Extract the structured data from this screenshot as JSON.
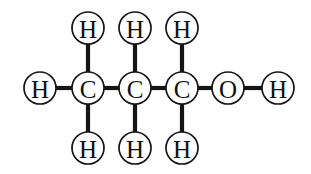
{
  "figure": {
    "background_color": "#ffffff",
    "bond_color": "#151515",
    "atom_circle_fill": "#ffffff",
    "atom_circle_stroke": "#151515",
    "atom_label_color": "#111111",
    "atom_radius": 16,
    "bond_width": 4.2,
    "circle_stroke_width": 1.7
  },
  "chart_data": {
    "type": "diagram",
    "diagram_kind": "chemical-structural-formula",
    "molecule": "propan-1-ol",
    "formula": "C3H8O",
    "condensed_formula": "CH3CH2CH2OH",
    "title": "",
    "atoms": [
      {
        "id": "H1",
        "label": "H",
        "element": "H",
        "x": 40,
        "y": 88,
        "role": "methyl-hydrogen-left"
      },
      {
        "id": "H2",
        "label": "H",
        "element": "H",
        "x": 88,
        "y": 28,
        "role": "hydrogen-top-c1"
      },
      {
        "id": "H3",
        "label": "H",
        "element": "H",
        "x": 88,
        "y": 148,
        "role": "hydrogen-bottom-c1"
      },
      {
        "id": "C1",
        "label": "C",
        "element": "C",
        "x": 88,
        "y": 88,
        "role": "carbon-1"
      },
      {
        "id": "H4",
        "label": "H",
        "element": "H",
        "x": 135,
        "y": 28,
        "role": "hydrogen-top-c2"
      },
      {
        "id": "H5",
        "label": "H",
        "element": "H",
        "x": 135,
        "y": 148,
        "role": "hydrogen-bottom-c2"
      },
      {
        "id": "C2",
        "label": "C",
        "element": "C",
        "x": 135,
        "y": 88,
        "role": "carbon-2"
      },
      {
        "id": "H6",
        "label": "H",
        "element": "H",
        "x": 182,
        "y": 28,
        "role": "hydrogen-top-c3"
      },
      {
        "id": "H7",
        "label": "H",
        "element": "H",
        "x": 182,
        "y": 148,
        "role": "hydrogen-bottom-c3"
      },
      {
        "id": "C3",
        "label": "C",
        "element": "C",
        "x": 182,
        "y": 88,
        "role": "carbon-3"
      },
      {
        "id": "O1",
        "label": "O",
        "element": "O",
        "x": 228,
        "y": 88,
        "role": "hydroxyl-oxygen"
      },
      {
        "id": "H8",
        "label": "H",
        "element": "H",
        "x": 278,
        "y": 88,
        "role": "hydroxyl-hydrogen"
      }
    ],
    "bonds": [
      {
        "id": "b1",
        "from": "H1",
        "to": "C1",
        "order": 1,
        "x1": 56,
        "y1": 88,
        "x2": 72,
        "y2": 88
      },
      {
        "id": "b2",
        "from": "H2",
        "to": "C1",
        "order": 1,
        "x1": 88,
        "y1": 44,
        "x2": 88,
        "y2": 72
      },
      {
        "id": "b3",
        "from": "C1",
        "to": "H3",
        "order": 1,
        "x1": 88,
        "y1": 104,
        "x2": 88,
        "y2": 132
      },
      {
        "id": "b4",
        "from": "C1",
        "to": "C2",
        "order": 1,
        "x1": 104,
        "y1": 88,
        "x2": 119,
        "y2": 88
      },
      {
        "id": "b5",
        "from": "H4",
        "to": "C2",
        "order": 1,
        "x1": 135,
        "y1": 44,
        "x2": 135,
        "y2": 72
      },
      {
        "id": "b6",
        "from": "C2",
        "to": "H5",
        "order": 1,
        "x1": 135,
        "y1": 104,
        "x2": 135,
        "y2": 132
      },
      {
        "id": "b7",
        "from": "C2",
        "to": "C3",
        "order": 1,
        "x1": 151,
        "y1": 88,
        "x2": 166,
        "y2": 88
      },
      {
        "id": "b8",
        "from": "H6",
        "to": "C3",
        "order": 1,
        "x1": 182,
        "y1": 44,
        "x2": 182,
        "y2": 72
      },
      {
        "id": "b9",
        "from": "C3",
        "to": "H7",
        "order": 1,
        "x1": 182,
        "y1": 104,
        "x2": 182,
        "y2": 132
      },
      {
        "id": "b10",
        "from": "C3",
        "to": "O1",
        "order": 1,
        "x1": 198,
        "y1": 88,
        "x2": 212,
        "y2": 88
      },
      {
        "id": "b11",
        "from": "O1",
        "to": "H8",
        "order": 1,
        "x1": 244,
        "y1": 88,
        "x2": 262,
        "y2": 88
      }
    ],
    "labels": {
      "hydrogen": "H",
      "carbon": "C",
      "oxygen": "O"
    },
    "legend": [],
    "annotations": []
  }
}
